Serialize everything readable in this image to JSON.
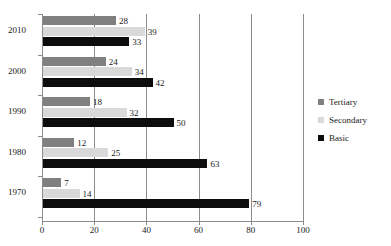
{
  "chart_data": {
    "type": "bar",
    "orientation": "horizontal",
    "title": "",
    "xlabel": "",
    "ylabel": "",
    "xlim": [
      0,
      100
    ],
    "xticks": [
      0,
      20,
      40,
      60,
      80,
      100
    ],
    "categories": [
      "2010",
      "2000",
      "1990",
      "1980",
      "1970"
    ],
    "grid": "vertical",
    "legend_position": "right",
    "series": [
      {
        "name": "Tertiary",
        "color": "#808080",
        "values": [
          28,
          24,
          18,
          12,
          7
        ]
      },
      {
        "name": "Secondary",
        "color": "#d9d9d9",
        "values": [
          39,
          34,
          32,
          25,
          14
        ]
      },
      {
        "name": "Basic",
        "color": "#0d0d0d",
        "values": [
          33,
          42,
          50,
          63,
          79
        ]
      }
    ]
  },
  "axis": {
    "x_tick_labels": [
      "0",
      "20",
      "40",
      "60",
      "80",
      "100"
    ],
    "y_tick_labels": [
      "2010",
      "2000",
      "1990",
      "1980",
      "1970"
    ]
  },
  "legend": {
    "items": [
      {
        "label": "Tertiary"
      },
      {
        "label": "Secondary"
      },
      {
        "label": "Basic"
      }
    ]
  },
  "values_flat": {
    "g0": {
      "tertiary": "28",
      "secondary": "39",
      "basic": "33"
    },
    "g1": {
      "tertiary": "24",
      "secondary": "34",
      "basic": "42"
    },
    "g2": {
      "tertiary": "18",
      "secondary": "32",
      "basic": "50"
    },
    "g3": {
      "tertiary": "12",
      "secondary": "25",
      "basic": "63"
    },
    "g4": {
      "tertiary": "7",
      "secondary": "14",
      "basic": "79"
    }
  },
  "colors": {
    "tertiary": "#808080",
    "secondary": "#d9d9d9",
    "basic": "#0d0d0d",
    "axis": "#8c8c8c",
    "text": "#1a1a1a",
    "background": "#ffffff"
  }
}
